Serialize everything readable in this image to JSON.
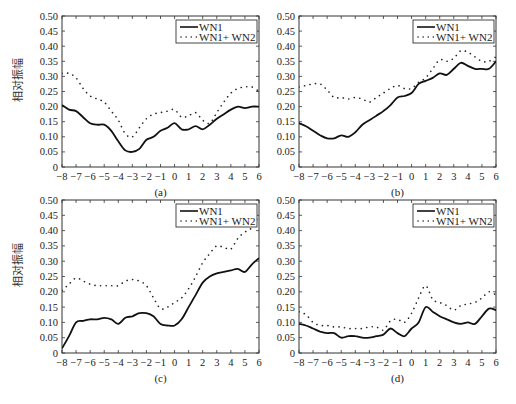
{
  "figure": {
    "ylabel": "相对振幅",
    "legend": {
      "series1": "WN1",
      "series2": "WN1+ WN2"
    },
    "xticks": [
      "-8",
      "-7",
      "-6",
      "-5",
      "-4",
      "-3",
      "-2",
      "-1",
      "0",
      "1",
      "2",
      "3",
      "4",
      "5",
      "6"
    ],
    "yticks": [
      "0",
      "0.05",
      "0.10",
      "0.15",
      "0.20",
      "0.25",
      "0.30",
      "0.35",
      "0.40",
      "0.45",
      "0.50"
    ],
    "colors": {
      "axis": "#333333",
      "line": "#111111",
      "dots": "#222222"
    }
  },
  "chart_data": [
    {
      "type": "line",
      "panel": "(a)",
      "title": "",
      "xlabel": "",
      "ylabel": "相对振幅",
      "xlim": [
        -8,
        6
      ],
      "ylim": [
        0,
        0.5
      ],
      "legend_position": "upper right",
      "x": [
        -8,
        -7.5,
        -7,
        -6.5,
        -6,
        -5.5,
        -5,
        -4.5,
        -4,
        -3.5,
        -3,
        -2.5,
        -2,
        -1.5,
        -1,
        -0.5,
        0,
        0.5,
        1,
        1.5,
        2,
        2.5,
        3,
        3.5,
        4,
        4.5,
        5,
        5.5,
        6
      ],
      "series": [
        {
          "name": "WN1",
          "style": "solid",
          "values": [
            0.205,
            0.19,
            0.185,
            0.165,
            0.145,
            0.14,
            0.14,
            0.12,
            0.085,
            0.055,
            0.05,
            0.06,
            0.09,
            0.1,
            0.12,
            0.13,
            0.145,
            0.125,
            0.125,
            0.135,
            0.125,
            0.14,
            0.16,
            0.175,
            0.19,
            0.2,
            0.195,
            0.2,
            0.2
          ]
        },
        {
          "name": "WN1+ WN2",
          "style": "dotted",
          "values": [
            0.31,
            0.31,
            0.295,
            0.26,
            0.235,
            0.225,
            0.215,
            0.185,
            0.155,
            0.11,
            0.1,
            0.13,
            0.16,
            0.175,
            0.18,
            0.185,
            0.19,
            0.165,
            0.17,
            0.18,
            0.155,
            0.145,
            0.18,
            0.215,
            0.245,
            0.26,
            0.265,
            0.265,
            0.25
          ]
        }
      ]
    },
    {
      "type": "line",
      "panel": "(b)",
      "title": "",
      "xlabel": "",
      "ylabel": "",
      "xlim": [
        -8,
        6
      ],
      "ylim": [
        0,
        0.5
      ],
      "legend_position": "upper right",
      "x": [
        -8,
        -7.5,
        -7,
        -6.5,
        -6,
        -5.5,
        -5,
        -4.5,
        -4,
        -3.5,
        -3,
        -2.5,
        -2,
        -1.5,
        -1,
        -0.5,
        0,
        0.5,
        1,
        1.5,
        2,
        2.5,
        3,
        3.5,
        4,
        4.5,
        5,
        5.5,
        6
      ],
      "series": [
        {
          "name": "WN1",
          "style": "solid",
          "values": [
            0.145,
            0.135,
            0.12,
            0.105,
            0.095,
            0.095,
            0.105,
            0.1,
            0.115,
            0.14,
            0.155,
            0.17,
            0.185,
            0.205,
            0.23,
            0.235,
            0.245,
            0.275,
            0.285,
            0.295,
            0.31,
            0.305,
            0.325,
            0.345,
            0.335,
            0.325,
            0.325,
            0.325,
            0.35
          ]
        },
        {
          "name": "WN1+ WN2",
          "style": "dotted",
          "values": [
            0.265,
            0.27,
            0.275,
            0.275,
            0.255,
            0.23,
            0.23,
            0.225,
            0.23,
            0.225,
            0.215,
            0.23,
            0.245,
            0.26,
            0.27,
            0.26,
            0.26,
            0.28,
            0.295,
            0.325,
            0.355,
            0.35,
            0.36,
            0.385,
            0.38,
            0.365,
            0.35,
            0.35,
            0.365
          ]
        }
      ]
    },
    {
      "type": "line",
      "panel": "(c)",
      "title": "",
      "xlabel": "",
      "ylabel": "相对振幅",
      "xlim": [
        -8,
        6
      ],
      "ylim": [
        0,
        0.5
      ],
      "legend_position": "upper right",
      "x": [
        -8,
        -7.5,
        -7,
        -6.5,
        -6,
        -5.5,
        -5,
        -4.5,
        -4,
        -3.5,
        -3,
        -2.5,
        -2,
        -1.5,
        -1,
        -0.5,
        0,
        0.5,
        1,
        1.5,
        2,
        2.5,
        3,
        3.5,
        4,
        4.5,
        5,
        5.5,
        6
      ],
      "series": [
        {
          "name": "WN1",
          "style": "solid",
          "values": [
            0.015,
            0.055,
            0.1,
            0.105,
            0.11,
            0.11,
            0.115,
            0.11,
            0.095,
            0.115,
            0.12,
            0.13,
            0.13,
            0.12,
            0.095,
            0.09,
            0.09,
            0.11,
            0.15,
            0.19,
            0.23,
            0.25,
            0.26,
            0.265,
            0.27,
            0.275,
            0.265,
            0.29,
            0.31
          ]
        },
        {
          "name": "WN1+ WN2",
          "style": "dotted",
          "values": [
            0.205,
            0.225,
            0.245,
            0.235,
            0.225,
            0.22,
            0.22,
            0.22,
            0.22,
            0.235,
            0.24,
            0.235,
            0.22,
            0.18,
            0.145,
            0.15,
            0.165,
            0.18,
            0.21,
            0.25,
            0.295,
            0.325,
            0.35,
            0.345,
            0.34,
            0.375,
            0.395,
            0.41,
            0.45
          ]
        }
      ]
    },
    {
      "type": "line",
      "panel": "(d)",
      "title": "",
      "xlabel": "",
      "ylabel": "",
      "xlim": [
        -8,
        6
      ],
      "ylim": [
        0,
        0.5
      ],
      "legend_position": "upper right",
      "x": [
        -8,
        -7.5,
        -7,
        -6.5,
        -6,
        -5.5,
        -5,
        -4.5,
        -4,
        -3.5,
        -3,
        -2.5,
        -2,
        -1.5,
        -1,
        -0.5,
        0,
        0.5,
        1,
        1.5,
        2,
        2.5,
        3,
        3.5,
        4,
        4.5,
        5,
        5.5,
        6
      ],
      "series": [
        {
          "name": "WN1",
          "style": "solid",
          "values": [
            0.095,
            0.09,
            0.08,
            0.07,
            0.065,
            0.065,
            0.05,
            0.055,
            0.055,
            0.05,
            0.05,
            0.055,
            0.06,
            0.08,
            0.065,
            0.055,
            0.08,
            0.1,
            0.15,
            0.135,
            0.12,
            0.11,
            0.1,
            0.095,
            0.1,
            0.095,
            0.12,
            0.145,
            0.14
          ]
        },
        {
          "name": "WN1+ WN2",
          "style": "dotted",
          "values": [
            0.135,
            0.125,
            0.1,
            0.09,
            0.09,
            0.085,
            0.085,
            0.08,
            0.08,
            0.08,
            0.085,
            0.085,
            0.075,
            0.105,
            0.11,
            0.1,
            0.13,
            0.18,
            0.22,
            0.175,
            0.165,
            0.155,
            0.14,
            0.155,
            0.16,
            0.165,
            0.18,
            0.2,
            0.19
          ]
        }
      ]
    }
  ]
}
